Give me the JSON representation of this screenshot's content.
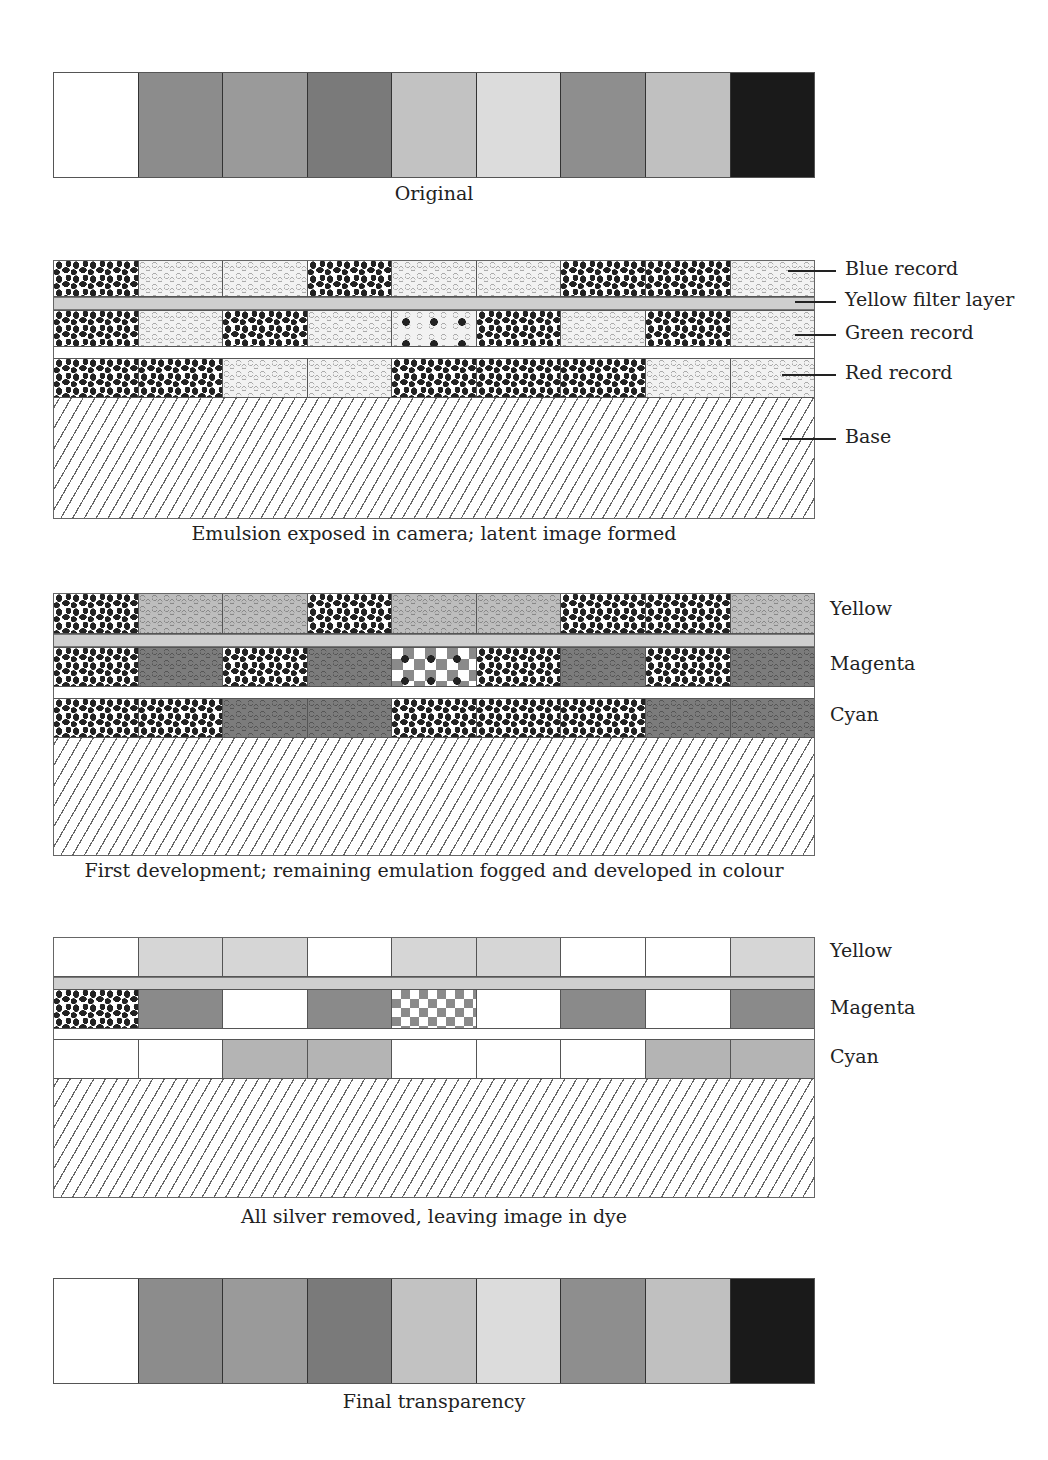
{
  "swatch_colors": [
    "#ffffff",
    "#8c8c8c",
    "#9a9a9a",
    "#7a7a7a",
    "#c2c2c2",
    "#dcdcdc",
    "#8e8e8e",
    "#c0c0c0",
    "#1a1a1a"
  ],
  "panels": {
    "original": {
      "caption": "Original"
    },
    "exposed": {
      "caption": "Emulsion exposed in camera; latent image formed",
      "rows": {
        "blue": [
          "dark",
          "light",
          "light",
          "dark",
          "light",
          "light",
          "dark",
          "dark",
          "light"
        ],
        "green": [
          "dark",
          "light",
          "dark",
          "light",
          "mixed",
          "dark",
          "light",
          "dark",
          "light"
        ],
        "red": [
          "dark",
          "dark",
          "light",
          "light",
          "dark",
          "dark",
          "dark",
          "light",
          "light"
        ]
      },
      "labels": {
        "blue": "Blue record",
        "filter": "Yellow filter layer",
        "green": "Green record",
        "red": "Red record",
        "base": "Base"
      }
    },
    "first_development": {
      "caption": "First development; remaining emulation fogged and developed in colour",
      "rows": {
        "yellow": [
          "dark",
          "grey",
          "grey",
          "dark",
          "grey",
          "grey",
          "dark",
          "dark",
          "grey"
        ],
        "magenta": [
          "dark",
          "dgrey",
          "dark",
          "dgrey",
          "mixed-mag",
          "dark",
          "dgrey",
          "dark",
          "dgrey"
        ],
        "cyan": [
          "dark",
          "dark",
          "dgrey",
          "dgrey",
          "dark",
          "dark",
          "dark",
          "dgrey",
          "dgrey"
        ]
      },
      "labels": {
        "yellow": "Yellow",
        "magenta": "Magenta",
        "cyan": "Cyan"
      }
    },
    "silver_removed": {
      "caption": "All silver removed, leaving image in dye",
      "rows": {
        "yellow": [
          "#ffffff",
          "#d6d6d6",
          "#d6d6d6",
          "#ffffff",
          "#d6d6d6",
          "#d6d6d6",
          "#ffffff",
          "#ffffff",
          "#d6d6d6"
        ],
        "magenta": [
          "dark",
          "#8a8a8a",
          "#ffffff",
          "#8a8a8a",
          "check",
          "#ffffff",
          "#8a8a8a",
          "#ffffff",
          "#8a8a8a"
        ],
        "cyan": [
          "#ffffff",
          "#ffffff",
          "#b4b4b4",
          "#b4b4b4",
          "#ffffff",
          "#ffffff",
          "#ffffff",
          "#b4b4b4",
          "#b4b4b4"
        ]
      },
      "labels": {
        "yellow": "Yellow",
        "magenta": "Magenta",
        "cyan": "Cyan"
      }
    },
    "final": {
      "caption": "Final transparency"
    }
  }
}
